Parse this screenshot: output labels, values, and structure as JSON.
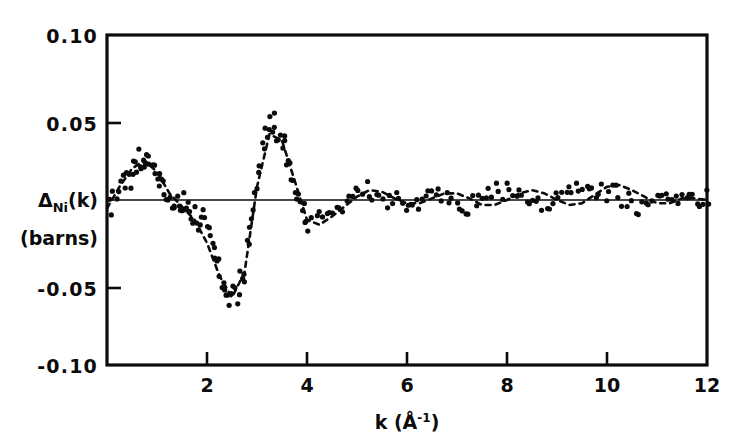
{
  "figure": {
    "title": "",
    "background_color": "#ffffff",
    "ink_color": "#0b0b0b"
  },
  "axes": {
    "y_title_line1": "Δ",
    "y_title_sub": "Ni",
    "y_title_rest": "(k)",
    "y_title_line2": "(barns)",
    "x_title_main": "k (Å",
    "x_title_sup": "-1",
    "x_title_close": ")",
    "x_ticks": [
      "2",
      "4",
      "6",
      "8",
      "10",
      "12"
    ],
    "x_tick_values": [
      2,
      4,
      6,
      8,
      10,
      12
    ],
    "y_ticks": [
      "0.10",
      "0.05",
      "-0.05",
      "-0.10"
    ],
    "y_tick_values": [
      0.1,
      0.05,
      -0.05,
      -0.1
    ],
    "zero_line_value": 0
  },
  "chart_data": {
    "type": "scatter",
    "title": "",
    "xlabel": "k (Å⁻¹)",
    "ylabel": "Δ_Ni(k) (barns)",
    "xlim": [
      0,
      12
    ],
    "ylim": [
      -0.1,
      0.1
    ],
    "grid": false,
    "legend": "none",
    "marker": "filled-circle",
    "marker_size_px": 4,
    "series": [
      {
        "name": "Δ_Ni(k) experimental data",
        "style": "points",
        "x": [
          0.05,
          0.12,
          0.2,
          0.28,
          0.34,
          0.4,
          0.45,
          0.5,
          0.55,
          0.6,
          0.64,
          0.68,
          0.72,
          0.76,
          0.8,
          0.85,
          0.9,
          0.95,
          1.0,
          1.05,
          1.1,
          1.15,
          1.2,
          1.25,
          1.3,
          1.35,
          1.4,
          1.45,
          1.5,
          1.55,
          1.6,
          1.65,
          1.7,
          1.75,
          1.8,
          1.85,
          1.9,
          1.95,
          2.0,
          2.05,
          2.1,
          2.15,
          2.2,
          2.25,
          2.3,
          2.35,
          2.4,
          2.45,
          2.5,
          2.55,
          2.6,
          2.65,
          2.7,
          2.75,
          2.8,
          2.85,
          2.9,
          2.95,
          3.0,
          3.05,
          3.1,
          3.15,
          3.2,
          3.25,
          3.3,
          3.35,
          3.4,
          3.45,
          3.5,
          3.55,
          3.6,
          3.65,
          3.7,
          3.75,
          3.8,
          3.85,
          3.9,
          3.95,
          4.0,
          4.1,
          4.2,
          4.3,
          4.4,
          4.5,
          4.6,
          4.7,
          4.8,
          4.9,
          5.0,
          5.1,
          5.2,
          5.3,
          5.4,
          5.5,
          5.6,
          5.7,
          5.8,
          5.9,
          6.0,
          6.1,
          6.2,
          6.3,
          6.4,
          6.5,
          6.6,
          6.7,
          6.8,
          6.9,
          7.0,
          7.1,
          7.2,
          7.3,
          7.4,
          7.5,
          7.6,
          7.7,
          7.8,
          7.9,
          8.0,
          8.1,
          8.2,
          8.3,
          8.4,
          8.5,
          8.6,
          8.7,
          8.8,
          8.9,
          9.0,
          9.1,
          9.2,
          9.3,
          9.4,
          9.5,
          9.6,
          9.7,
          9.8,
          9.9,
          10.0,
          10.1,
          10.2,
          10.3,
          10.4,
          10.5,
          10.6,
          10.7,
          10.8,
          10.9,
          11.0,
          11.1,
          11.2,
          11.3,
          11.4,
          11.5,
          11.6,
          11.7,
          11.8,
          11.9,
          12.0
        ],
        "y": [
          -0.004,
          0.001,
          0.004,
          0.008,
          0.01,
          0.019,
          0.012,
          0.013,
          0.02,
          0.022,
          0.026,
          0.024,
          0.025,
          0.024,
          0.026,
          0.025,
          0.021,
          0.019,
          0.016,
          0.013,
          0.011,
          0.008,
          0.004,
          0.002,
          0.0,
          -0.001,
          0.0,
          -0.002,
          -0.001,
          0.0,
          -0.001,
          -0.007,
          -0.01,
          -0.009,
          -0.013,
          -0.016,
          -0.01,
          -0.012,
          -0.022,
          -0.026,
          -0.031,
          -0.03,
          -0.038,
          -0.046,
          -0.051,
          -0.053,
          -0.062,
          -0.063,
          -0.056,
          -0.058,
          -0.06,
          -0.049,
          -0.045,
          -0.04,
          -0.03,
          -0.02,
          -0.01,
          0.002,
          0.012,
          0.02,
          0.03,
          0.038,
          0.042,
          0.046,
          0.047,
          0.044,
          0.04,
          0.038,
          0.034,
          0.03,
          0.025,
          0.02,
          0.012,
          0.006,
          0.0,
          -0.004,
          -0.008,
          -0.012,
          -0.016,
          -0.014,
          -0.012,
          -0.01,
          -0.011,
          -0.009,
          -0.006,
          -0.005,
          -0.002,
          0.001,
          0.004,
          0.006,
          0.007,
          0.006,
          0.004,
          0.003,
          0.001,
          0.0,
          -0.001,
          -0.002,
          -0.002,
          -0.001,
          0.0,
          0.001,
          0.003,
          0.004,
          0.004,
          0.003,
          0.002,
          0.0,
          -0.002,
          -0.003,
          -0.004,
          -0.003,
          -0.002,
          0.0,
          0.002,
          0.004,
          0.005,
          0.006,
          0.005,
          0.004,
          0.002,
          0.0,
          -0.002,
          -0.003,
          -0.003,
          -0.002,
          -0.001,
          0.001,
          0.003,
          0.005,
          0.007,
          0.008,
          0.009,
          0.01,
          0.009,
          0.008,
          0.007,
          0.006,
          0.005,
          0.004,
          0.003,
          0.002,
          0.0,
          -0.002,
          -0.003,
          -0.004,
          -0.003,
          -0.002,
          0.0,
          0.001,
          0.002,
          0.002,
          0.001,
          0.0,
          0.0,
          -0.001,
          -0.001,
          0.0,
          0.0
        ],
        "scatter_noise_amplitude": 0.006
      },
      {
        "name": "fitted model curve",
        "style": "dashed-line",
        "x": [
          0.0,
          0.25,
          0.5,
          0.75,
          1.0,
          1.25,
          1.5,
          1.75,
          2.0,
          2.25,
          2.5,
          2.75,
          3.0,
          3.25,
          3.5,
          3.75,
          4.0,
          4.25,
          4.5,
          4.75,
          5.0,
          5.25,
          5.5,
          5.75,
          6.0,
          6.25,
          6.5,
          6.75,
          7.0,
          7.25,
          7.5,
          7.75,
          8.0,
          8.25,
          8.5,
          8.75,
          9.0,
          9.25,
          9.5,
          9.75,
          10.0,
          10.25,
          10.5,
          10.75,
          11.0,
          11.25,
          11.5,
          11.75,
          12.0
        ],
        "y": [
          -0.005,
          0.008,
          0.019,
          0.024,
          0.017,
          0.004,
          -0.004,
          -0.012,
          -0.026,
          -0.046,
          -0.059,
          -0.044,
          0.008,
          0.04,
          0.036,
          0.012,
          -0.012,
          -0.015,
          -0.01,
          -0.004,
          0.002,
          0.006,
          0.005,
          0.001,
          -0.002,
          -0.002,
          0.001,
          0.004,
          0.004,
          0.001,
          -0.003,
          -0.003,
          0.0,
          0.004,
          0.006,
          0.004,
          0.0,
          -0.003,
          -0.002,
          0.003,
          0.008,
          0.009,
          0.006,
          0.002,
          -0.002,
          -0.002,
          0.001,
          0.001,
          0.0
        ]
      }
    ]
  }
}
